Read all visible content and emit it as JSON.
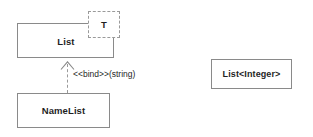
{
  "diagram": {
    "type": "uml-class-diagram",
    "background_color": "#ffffff",
    "line_color": "#8a8a8a",
    "dashed_line_color": "#9a9a9a",
    "text_color": "#1f1f1f"
  },
  "classes": [
    {
      "id": "list",
      "name": "List",
      "kind": "template-classifier",
      "border": "solid"
    },
    {
      "id": "namelist",
      "name": "NameList",
      "kind": "bound-classifier",
      "border": "solid"
    },
    {
      "id": "listinteger",
      "name": "List<Integer>",
      "kind": "bound-classifier-anonymous",
      "border": "solid"
    }
  ],
  "template_parameter": {
    "name": "T",
    "border": "dashed",
    "owner": "list"
  },
  "relationships": [
    {
      "id": "binding",
      "kind": "dependency",
      "stereotype": "<<bind>>",
      "arguments": "(string)",
      "label": "<<bind>>(string)",
      "source": "namelist",
      "target": "list",
      "line": "dashed",
      "arrowhead": "open"
    }
  ]
}
